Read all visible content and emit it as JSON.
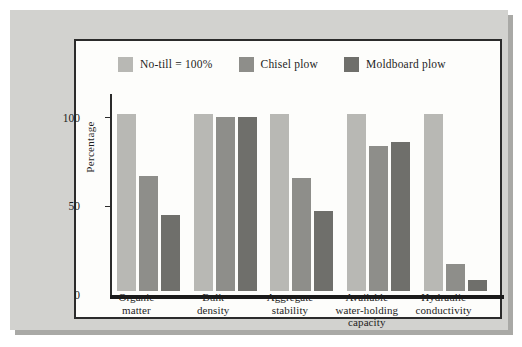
{
  "chart_data": {
    "type": "bar",
    "title": "",
    "subtitle": "",
    "xlabel": "",
    "ylabel": "Percentage",
    "ylim": [
      0,
      110
    ],
    "yticks": [
      0,
      50,
      100
    ],
    "ytick_labels": [
      "0",
      "50",
      "100"
    ],
    "grid": false,
    "legend_position": "top",
    "categories": [
      "Organic\nmatter",
      "Bulk\ndensity",
      "Aggregate\nstability",
      "Available\nwater-holding\ncapacity",
      "Hydraulic\nconductivity"
    ],
    "category_lines": [
      [
        "Organic",
        "matter"
      ],
      [
        "Bulk",
        "density"
      ],
      [
        "Aggregate",
        "stability"
      ],
      [
        "Available",
        "water-holding",
        "capacity"
      ],
      [
        "Hydraulic",
        "conductivity"
      ]
    ],
    "series": [
      {
        "name": "No-till = 100%",
        "color": "#b8b8b4",
        "values": [
          100,
          100,
          100,
          100,
          100
        ]
      },
      {
        "name": "Chisel plow",
        "color": "#8e8e8a",
        "values": [
          65,
          98,
          64,
          82,
          15
        ]
      },
      {
        "name": "Moldboard plow",
        "color": "#6f6f6b",
        "values": [
          43,
          98,
          45,
          84,
          6
        ]
      }
    ]
  },
  "legend": {
    "entries": [
      {
        "label": "No-till = 100%",
        "swatch": "#b8b8b4"
      },
      {
        "label": "Chisel plow",
        "swatch": "#8e8e8a"
      },
      {
        "label": "Moldboard plow",
        "swatch": "#6f6f6b"
      }
    ]
  },
  "axes": {
    "y_title": "Percentage",
    "y_ticks": [
      "100",
      "50",
      "0"
    ]
  },
  "colors": {
    "mat_background": "#d2d2cf",
    "panel_background": "#fdfdfb",
    "panel_border": "#2b2b2b",
    "shadow": "#a9a9a6",
    "text": "#1d1d1d"
  }
}
